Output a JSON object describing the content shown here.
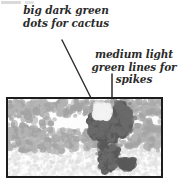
{
  "diagram": {
    "annotations": [
      {
        "id": "cactus-dots",
        "lines": [
          "big dark green",
          "dots for cactus"
        ],
        "line1": "big dark green",
        "line2": "dots for cactus",
        "points_to": "dark green dot cluster forming the cactus body"
      },
      {
        "id": "spike-lines",
        "lines": [
          "medium light",
          "green lines for",
          "spikes"
        ],
        "line1": "medium light",
        "line2": "green lines for",
        "line3": "spikes",
        "points_to": "light green line marks representing the cactus spikes"
      }
    ],
    "arrows": [
      {
        "id": "arrow-to-cactus",
        "direction": "diagonal-down-right",
        "from": [
          62,
          40
        ],
        "to": [
          96,
          110
        ]
      },
      {
        "id": "arrow-to-spikes",
        "direction": "vertical-down",
        "from": [
          112,
          74
        ],
        "to": [
          112,
          110
        ]
      }
    ],
    "picture": {
      "id": "cactus-scene",
      "description": "Framed grayscale dot-pattern image of a saguaro-like cactus on speckled ground",
      "frame_color": "#1d1d1d",
      "background_color": "#fdfdfd",
      "colors": {
        "cactus_dark": "#595959",
        "cactus_dark_alt": "#6b6b6b",
        "brush_medium": "#a3a3a3",
        "brush_medium_alt": "#b4b4b4",
        "ground_light": "#dadada",
        "ground_light_alt": "#e6e6e6",
        "highlight": "#f2f2f2"
      }
    }
  }
}
